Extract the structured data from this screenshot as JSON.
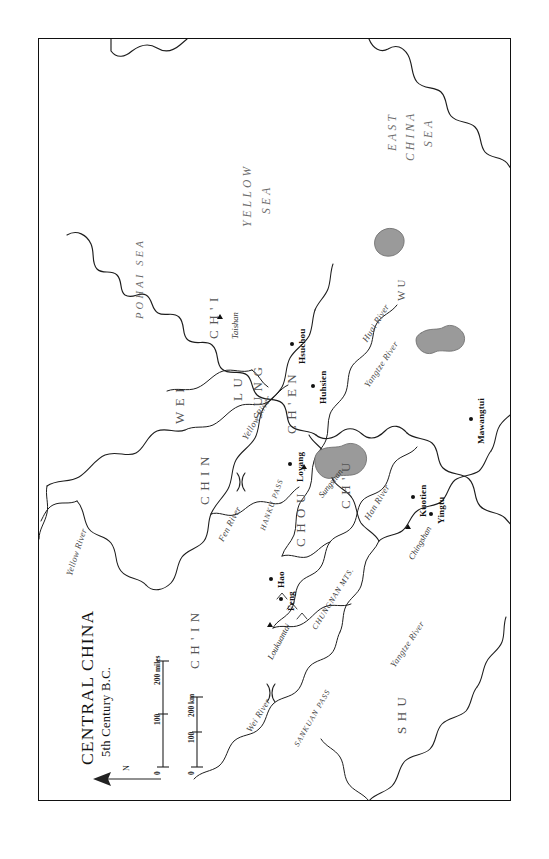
{
  "map": {
    "title": "CENTRAL CHINA",
    "subtitle": "5th Century B.C.",
    "orientation_note": "north-arrow",
    "frame_color": "#111111",
    "water_fill_color": "#9a9a9a",
    "background_color": "#ffffff"
  },
  "scale": {
    "miles": {
      "unit_label": "200 miles",
      "ticks": [
        "0",
        "100",
        "200"
      ]
    },
    "km": {
      "unit_label": "200 km",
      "ticks": [
        "0",
        "100",
        "200"
      ]
    }
  },
  "seas": [
    {
      "name": "YELLOW SEA",
      "lines": [
        "YELLOW",
        "SEA"
      ]
    },
    {
      "name": "EAST CHINA SEA",
      "lines": [
        "EAST",
        "CHINA",
        "SEA"
      ]
    },
    {
      "name": "POHAI SEA",
      "lines": [
        "POHAI SEA"
      ]
    }
  ],
  "states": [
    {
      "label": "CH'I"
    },
    {
      "label": "WEI"
    },
    {
      "label": "LU"
    },
    {
      "label": "SUNG"
    },
    {
      "label": "CH'EN"
    },
    {
      "label": "CHIN"
    },
    {
      "label": "CHOU"
    },
    {
      "label": "CH'IN"
    },
    {
      "label": "CH'U"
    },
    {
      "label": "WU"
    },
    {
      "label": "SHU"
    }
  ],
  "cities": [
    {
      "label": "Hsuchou",
      "symbol": "dot"
    },
    {
      "label": "Huhsien",
      "symbol": "dot"
    },
    {
      "label": "Loyang",
      "symbol": "dot"
    },
    {
      "label": "Hao",
      "symbol": "dot"
    },
    {
      "label": "Feng",
      "symbol": "dot"
    },
    {
      "label": "Kuotien",
      "symbol": "dot"
    },
    {
      "label": "Yingtu",
      "symbol": "dot"
    },
    {
      "label": "Mawangtui",
      "symbol": "dot"
    }
  ],
  "mountains": [
    {
      "label": "Taishan",
      "symbol": "triangle"
    },
    {
      "label": "Sungshan",
      "symbol": "triangle"
    },
    {
      "label": "Loukuantai",
      "symbol": "triangle"
    },
    {
      "label": "Chingshan",
      "symbol": "triangle"
    },
    {
      "label": "CHUNGNAN MTS.",
      "symbol": "range"
    }
  ],
  "passes": [
    {
      "label": "HANKU PASS"
    },
    {
      "label": "SANKUAN PASS"
    }
  ],
  "rivers": [
    {
      "label": "Yellow River"
    },
    {
      "label": "Yellow River"
    },
    {
      "label": "Fen River"
    },
    {
      "label": "Wei River"
    },
    {
      "label": "Huai River"
    },
    {
      "label": "Han River"
    },
    {
      "label": "Yangtze River"
    },
    {
      "label": "Yangtze River"
    }
  ]
}
